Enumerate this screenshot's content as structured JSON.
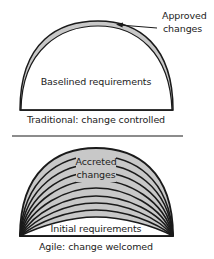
{
  "diagram": {
    "colors": {
      "fill": "#c8c8c8",
      "stroke": "#1a1a1a",
      "background": "#ffffff",
      "text": "#222222"
    },
    "traditional": {
      "caption": "Traditional: change controlled",
      "core_label": "Baselined requirements",
      "changes_label_line1": "Approved",
      "changes_label_line2": "changes",
      "core_region": "white semicircle",
      "change_region": "thin gray crescent on outer edge"
    },
    "agile": {
      "caption": "Agile: change welcomed",
      "core_label": "Initial requirements",
      "changes_label_line1": "Accreted",
      "changes_label_line2": "changes",
      "arc_count": 9
    }
  }
}
